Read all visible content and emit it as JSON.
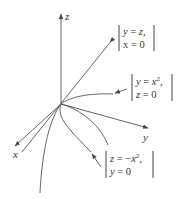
{
  "diagram": {
    "axes": {
      "x_label": "x",
      "y_label": "y",
      "z_label": "z"
    },
    "annotations": [
      {
        "name": "line-y-eq-z",
        "line1": "y = z,",
        "line2": "x = 0",
        "curve": "line y = z in plane x = 0"
      },
      {
        "name": "parabola-y-eq-x2",
        "line1": "y = x²,",
        "line2": "z = 0",
        "curve": "parabola y = x^2 in plane z = 0"
      },
      {
        "name": "parabola-z-eq-neg-x2",
        "line1": "z = −x²,",
        "line2": "y = 0",
        "curve": "parabola z = -x^2 in plane y = 0"
      }
    ],
    "colors": {
      "stroke": "#555555",
      "text": "#333333",
      "background": "#ffffff"
    }
  }
}
